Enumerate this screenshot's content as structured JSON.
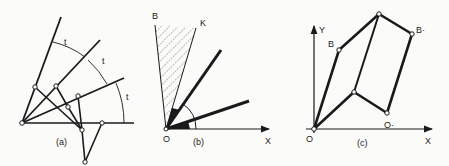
{
  "figure": {
    "colors": {
      "ink": "#1a1a1a",
      "background": "#fbfbfa"
    },
    "panels": [
      {
        "id": "a",
        "caption": "(a)",
        "arc_labels": [
          "t",
          "t",
          "t"
        ]
      },
      {
        "id": "b",
        "caption": "(b)",
        "labels": {
          "origin": "O",
          "x_axis": "X",
          "ray_b": "B",
          "ray_k": "K"
        }
      },
      {
        "id": "c",
        "caption": "(c)",
        "labels": {
          "origin": "O",
          "x_axis": "X",
          "y_axis": "Y",
          "b": "B",
          "b_prime": "B·",
          "o_prime": "O·"
        }
      }
    ]
  }
}
